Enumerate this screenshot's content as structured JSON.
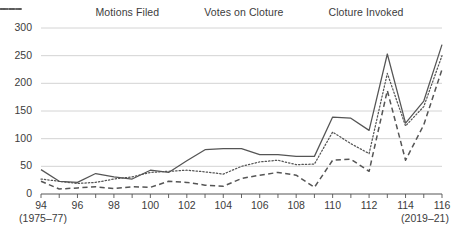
{
  "legend": {
    "position": "top-center",
    "items": [
      {
        "label": "Motions Filed",
        "style": "solid",
        "icon": "solid-line-swatch"
      },
      {
        "label": "Votes on Cloture",
        "style": "dotted",
        "icon": "dotted-line-swatch"
      },
      {
        "label": "Cloture Invoked",
        "style": "dashed",
        "icon": "dashed-line-swatch"
      }
    ]
  },
  "axis": {
    "y_ticks": [
      "0",
      "50",
      "100",
      "150",
      "200",
      "250",
      "300"
    ],
    "x_ticks": [
      "94",
      "96",
      "98",
      "100",
      "102",
      "104",
      "106",
      "108",
      "110",
      "112",
      "114",
      "116"
    ],
    "x_start_note": "(1975–77)",
    "x_end_note": "(2019–21)"
  },
  "colors": {
    "line": "#555555",
    "gridline": "#cfcfcf",
    "axis": "#555555",
    "text": "#3c3c3c",
    "background": "#ffffff"
  },
  "chart_data": {
    "type": "line",
    "title": "",
    "subtitle": "",
    "xlabel": "",
    "ylabel": "",
    "xlim": [
      94,
      116
    ],
    "ylim": [
      0,
      300
    ],
    "grid": true,
    "legend_position": "top-center",
    "x": [
      94,
      95,
      96,
      97,
      98,
      99,
      100,
      101,
      102,
      103,
      104,
      105,
      106,
      107,
      108,
      109,
      110,
      111,
      112,
      113,
      114,
      115,
      116
    ],
    "x_labels": [
      "94",
      "95",
      "96",
      "97",
      "98",
      "99",
      "100",
      "101",
      "102",
      "103",
      "104",
      "105",
      "106",
      "107",
      "108",
      "109",
      "110",
      "111",
      "112",
      "113",
      "114",
      "115",
      "116"
    ],
    "series": [
      {
        "name": "Motions Filed",
        "style": "solid",
        "values": [
          44,
          23,
          21,
          37,
          31,
          27,
          43,
          39,
          60,
          80,
          82,
          82,
          71,
          71,
          68,
          68,
          139,
          137,
          115,
          253,
          128,
          168,
          270
        ]
      },
      {
        "name": "Votes on Cloture",
        "style": "dotted",
        "values": [
          27,
          23,
          19,
          21,
          27,
          31,
          39,
          41,
          43,
          40,
          36,
          50,
          58,
          61,
          53,
          54,
          112,
          91,
          73,
          218,
          123,
          158,
          250
        ]
      },
      {
        "name": "Cloture Invoked",
        "style": "dashed",
        "values": [
          23,
          9,
          11,
          13,
          10,
          13,
          12,
          23,
          21,
          16,
          14,
          28,
          34,
          39,
          34,
          12,
          61,
          63,
          41,
          187,
          61,
          125,
          225
        ]
      }
    ]
  }
}
